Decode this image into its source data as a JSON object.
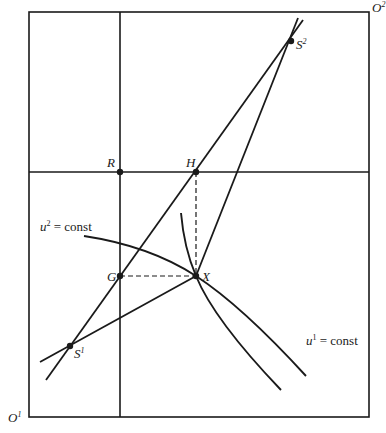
{
  "diagram": {
    "type": "edgeworth-box",
    "colors": {
      "line": "#1a1a1a",
      "background": "#ffffff"
    },
    "origins": [
      {
        "id": "O1",
        "base": "O",
        "sup": "1",
        "position": "bottom-left"
      },
      {
        "id": "O2",
        "base": "O",
        "sup": "2",
        "position": "top-right"
      }
    ],
    "points": [
      {
        "id": "S2",
        "base": "S",
        "sup": "2",
        "x": 291,
        "y": 41
      },
      {
        "id": "S1",
        "base": "S",
        "sup": "1",
        "x": 70,
        "y": 346
      },
      {
        "id": "R",
        "base": "R",
        "sup": "",
        "x": 120,
        "y": 172
      },
      {
        "id": "H",
        "base": "H",
        "sup": "",
        "x": 196,
        "y": 172
      },
      {
        "id": "G",
        "base": "G",
        "sup": "",
        "x": 120,
        "y": 276
      },
      {
        "id": "X",
        "base": "X",
        "sup": "",
        "x": 196,
        "y": 276
      }
    ],
    "curve_labels": [
      {
        "id": "u2",
        "base": "u",
        "sup": "2",
        "rest": " = const"
      },
      {
        "id": "u1",
        "base": "u",
        "sup": "1",
        "rest": " = const"
      }
    ]
  }
}
